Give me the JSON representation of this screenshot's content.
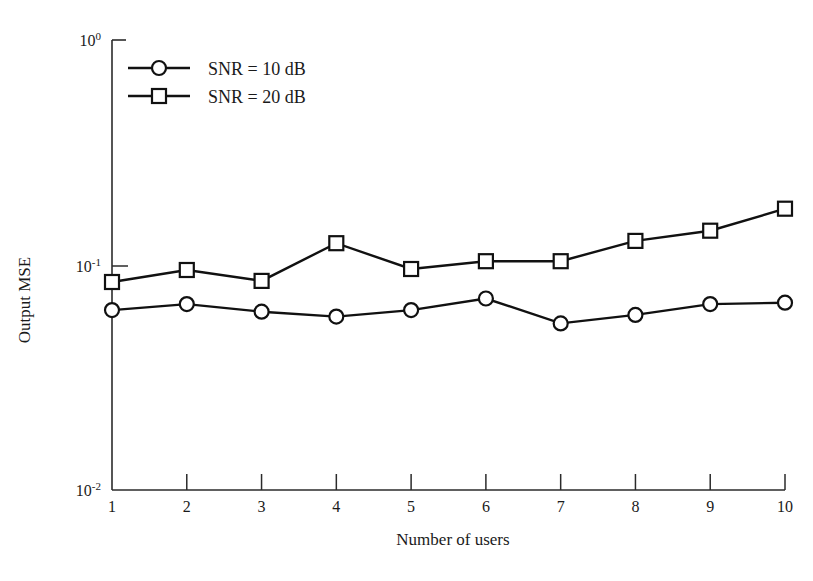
{
  "chart_data": {
    "type": "line",
    "title": "",
    "xlabel": "Number of users",
    "ylabel": "Output MSE",
    "x": [
      1,
      2,
      3,
      4,
      5,
      6,
      7,
      8,
      9,
      10
    ],
    "xlim": [
      1,
      10
    ],
    "ylim": [
      0.01,
      1
    ],
    "yscale": "log",
    "xscale": "linear",
    "grid": false,
    "legend_position": "upper-left-inside",
    "xtick_labels": [
      "1",
      "2",
      "3",
      "4",
      "5",
      "6",
      "7",
      "8",
      "9",
      "10"
    ],
    "ytick_labels": [
      "10-2",
      "10-1",
      "100"
    ],
    "ytick_values": [
      0.01,
      0.1,
      1
    ],
    "ytick_mantissa": [
      "10",
      "10",
      "10"
    ],
    "ytick_exponents": [
      "-2",
      "-1",
      "0"
    ],
    "series": [
      {
        "name": "SNR = 10 dB",
        "marker": "circle",
        "values": [
          0.063,
          0.067,
          0.062,
          0.059,
          0.063,
          0.071,
          0.055,
          0.06,
          0.067,
          0.068
        ]
      },
      {
        "name": "SNR = 20 dB",
        "marker": "square",
        "values": [
          0.084,
          0.095,
          0.085,
          0.125,
          0.096,
          0.104,
          0.104,
          0.128,
          0.142,
          0.178
        ]
      }
    ]
  },
  "legend": {
    "entries": [
      {
        "label": "SNR = 10 dB",
        "marker": "circle"
      },
      {
        "label": "SNR = 20 dB",
        "marker": "square"
      }
    ]
  },
  "axes": {
    "x_title": "Number of users",
    "y_title": "Output MSE"
  },
  "colors": {
    "line": "#111111",
    "axis": "#2b2b2b",
    "marker_fill": "#ffffff",
    "background": "#ffffff"
  }
}
